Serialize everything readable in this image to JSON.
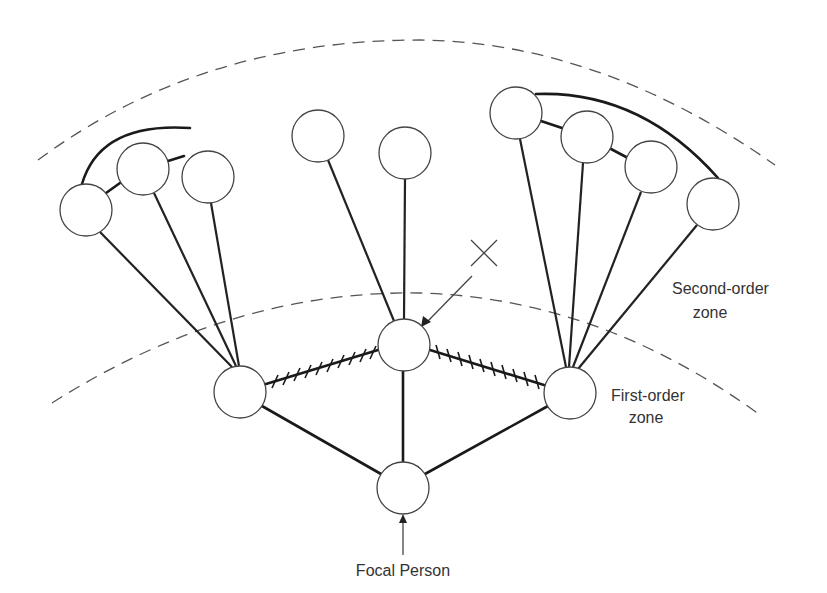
{
  "diagram": {
    "labels": {
      "second_order_line1": "Second-order",
      "second_order_line2": "zone",
      "first_order_line1": "First-order",
      "first_order_line2": "zone",
      "focal": "Focal Person",
      "x_marker": "X"
    },
    "colors": {
      "line": "#1a1a1a",
      "node_stroke": "#444444",
      "dashed_zone": "#555555",
      "background": "#ffffff"
    },
    "nodes": {
      "focal": {
        "x": 403,
        "y": 488,
        "r": 26
      },
      "first_order": [
        {
          "id": "f-left",
          "x": 240,
          "y": 392,
          "r": 26
        },
        {
          "id": "f-center-x",
          "x": 404,
          "y": 345,
          "r": 26
        },
        {
          "id": "f-right",
          "x": 570,
          "y": 393,
          "r": 26
        }
      ],
      "second_order": [
        {
          "id": "s1",
          "x": 86,
          "y": 210,
          "r": 26
        },
        {
          "id": "s2",
          "x": 143,
          "y": 169,
          "r": 26
        },
        {
          "id": "s3",
          "x": 208,
          "y": 177,
          "r": 26
        },
        {
          "id": "s4",
          "x": 318,
          "y": 136,
          "r": 26
        },
        {
          "id": "s5",
          "x": 405,
          "y": 153,
          "r": 26
        },
        {
          "id": "s6",
          "x": 516,
          "y": 113,
          "r": 26
        },
        {
          "id": "s7",
          "x": 587,
          "y": 137,
          "r": 26
        },
        {
          "id": "s8",
          "x": 651,
          "y": 167,
          "r": 26
        },
        {
          "id": "s9",
          "x": 713,
          "y": 204,
          "r": 26
        }
      ]
    }
  }
}
